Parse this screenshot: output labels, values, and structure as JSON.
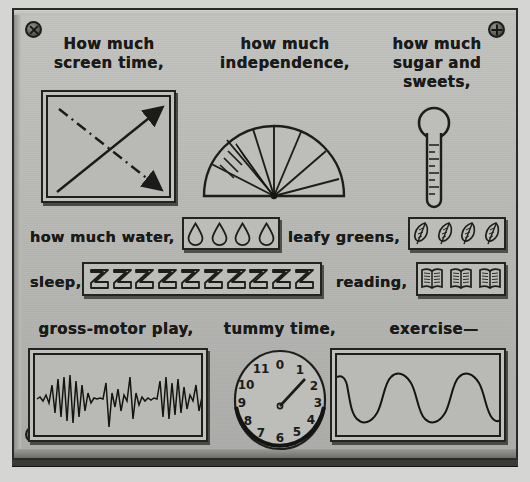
{
  "panel": {
    "title": "parenting control panel",
    "background_color": "#b9b9b6",
    "ink_color": "#1b1b19",
    "screws": [
      {
        "name": "screw-top-left",
        "style": "x"
      },
      {
        "name": "screw-top-right",
        "style": "plus"
      },
      {
        "name": "screw-bottom-left",
        "style": "plus"
      },
      {
        "name": "screw-bottom-right",
        "style": "plus"
      }
    ]
  },
  "labels": {
    "screen_time": "How much\nscreen time,",
    "independence": "how much\nindependence,",
    "sugar": "how much\nsugar and\nsweets,",
    "water": "how much water,",
    "greens": "leafy greens,",
    "sleep": "sleep,",
    "reading": "reading,",
    "gross_motor": "gross-motor play,",
    "tummy_time": "tummy time,",
    "exercise": "exercise—"
  },
  "widgets": {
    "screen_time_display": {
      "name": "screen-time-display",
      "type": "monitor",
      "arrows": [
        {
          "name": "solid-up-right-arrow",
          "style": "solid",
          "direction": "up-right"
        },
        {
          "name": "dashed-down-right-arrow",
          "style": "dashed",
          "direction": "down-right"
        }
      ]
    },
    "independence_gauge": {
      "name": "independence-gauge",
      "type": "semicircle-gauge",
      "sector_count": 7,
      "needle_angle_deg": 150,
      "tick_marks": 3
    },
    "sugar_thermometer": {
      "name": "sugar-thermometer",
      "type": "thermometer",
      "bulb_position": "top",
      "tick_count": 9
    },
    "water_meter": {
      "name": "water-meter",
      "type": "icon-row",
      "icon": "water-drop-icon",
      "count": 4
    },
    "greens_meter": {
      "name": "leafy-greens-meter",
      "type": "icon-row",
      "icon": "leaf-icon",
      "count": 4
    },
    "sleep_meter": {
      "name": "sleep-meter",
      "type": "icon-row",
      "icon": "letter-z-icon",
      "count": 10,
      "glyph": "Z"
    },
    "reading_meter": {
      "name": "reading-meter",
      "type": "icon-row",
      "icon": "open-book-icon",
      "count": 3
    },
    "gross_motor_display": {
      "name": "gross-motor-seismograph",
      "type": "waveform",
      "waveform": "seismic-spikes"
    },
    "tummy_time_clock": {
      "name": "tummy-time-clock",
      "type": "analog-clock",
      "hour_numbers": [
        "0",
        "1",
        "2",
        "3",
        "4",
        "5",
        "6",
        "7",
        "8",
        "9",
        "10",
        "11"
      ],
      "hand_count": 1,
      "hand_points_to": "1"
    },
    "exercise_display": {
      "name": "exercise-oscilloscope",
      "type": "waveform",
      "waveform": "rounded-square-wave",
      "cycles": 3
    }
  }
}
